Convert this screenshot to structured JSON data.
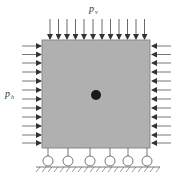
{
  "diagram": {
    "type": "loaded-block-on-roller-supports",
    "labels": {
      "top_load": {
        "base": "p",
        "sub": "v"
      },
      "side_load": {
        "base": "p",
        "sub": "h"
      }
    },
    "block": {
      "x": 42,
      "y": 40,
      "width": 108,
      "height": 108,
      "fill": "#a9a9a9",
      "stroke": "#6e6e6e"
    },
    "center_point": {
      "cx": 96,
      "cy": 95,
      "r": 5,
      "color": "#1a1a1a"
    },
    "top_arrows": {
      "count": 12,
      "direction": "down",
      "color": "#333333"
    },
    "left_arrows": {
      "count": 12,
      "direction": "right",
      "color": "#333333"
    },
    "right_arrows": {
      "count": 12,
      "direction": "left",
      "color": "#333333"
    },
    "supports": {
      "type": "roller",
      "count": 6,
      "x": [
        48,
        68,
        90,
        110,
        128,
        147
      ]
    },
    "ground": {
      "y": 167,
      "hatch": true
    },
    "caption": ""
  }
}
